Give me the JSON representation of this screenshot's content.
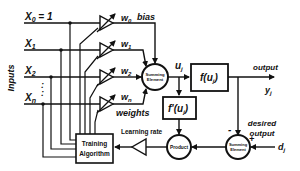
{
  "diagram": {
    "inputs_label": "Inputs",
    "inputs": [
      {
        "name": "x0",
        "label": "X",
        "sub": "0",
        "suffix": " = 1"
      },
      {
        "name": "x1",
        "label": "X",
        "sub": "1",
        "suffix": ""
      },
      {
        "name": "x2",
        "label": "X",
        "sub": "2",
        "suffix": ""
      },
      {
        "name": "xn",
        "label": "X",
        "sub": "n",
        "suffix": ""
      }
    ],
    "weights": [
      {
        "label": "w",
        "sub": "0"
      },
      {
        "label": "w",
        "sub": "1"
      },
      {
        "label": "w",
        "sub": "2"
      },
      {
        "label": "w",
        "sub": "n"
      }
    ],
    "bias_label": "bias",
    "weights_label": "weights",
    "summing_element": {
      "line1": "Summing",
      "line2": "Element"
    },
    "u_label": {
      "main": "u",
      "sub": "j"
    },
    "activation": {
      "main": "f(u",
      "sub": "j",
      "close": ")"
    },
    "derivative": {
      "main": "f'(u",
      "sub": "j",
      "close": ")"
    },
    "output_label": "output",
    "y_label": {
      "main": "y",
      "sub": "j"
    },
    "desired_output": {
      "line1": "desired",
      "line2": "output"
    },
    "d_label": {
      "main": "d",
      "sub": "j"
    },
    "minus_sign": "-",
    "plus_sign": "+",
    "product_label": "Product",
    "error_sum": {
      "line1": "Summing",
      "line2": "Element"
    },
    "learning_rate_label": "Learning rate",
    "training": {
      "line1": "Training",
      "line2": "Algorithm"
    },
    "dots": ":"
  }
}
